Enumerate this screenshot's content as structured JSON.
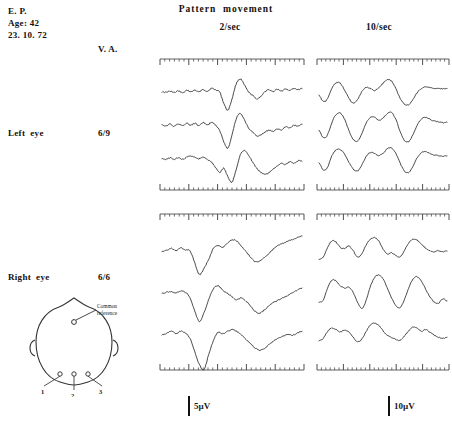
{
  "figure": {
    "title": "Pattern  movement",
    "columns": [
      {
        "id": "2sec",
        "label": "2/sec",
        "calibration": "5µV"
      },
      {
        "id": "10sec",
        "label": "10/sec",
        "calibration": "10µV"
      }
    ],
    "va_header": "V. A."
  },
  "patient": {
    "id": "E. P.",
    "age": "Age: 42",
    "date": "23. 10. 72"
  },
  "rows": [
    {
      "id": "left-eye",
      "label": "Left  eye",
      "va": "6/9"
    },
    {
      "id": "right-eye",
      "label": "Right  eye",
      "va": "6/6"
    }
  ],
  "head_diagram": {
    "reference_label": "Common\nreference",
    "electrodes": [
      {
        "name": "electrode-1",
        "label": "1"
      },
      {
        "name": "electrode-2",
        "label": "2"
      },
      {
        "name": "electrode-3",
        "label": "3"
      }
    ]
  },
  "colors": {
    "trace": "#2a2a2a",
    "ruler": "#3a3a3a",
    "text": "#111111",
    "background": "#ffffff"
  },
  "chart_data": {
    "type": "line",
    "title": "Pattern movement",
    "xlabel": "",
    "ylabel": "",
    "grid": false,
    "legend": "none",
    "ruler": {
      "minor_ticks": 30,
      "major_every": 6
    },
    "panels": [
      {
        "id": "le-2",
        "eye": "Left eye",
        "rate": "2/sec",
        "calibration": "5µV",
        "series": [
          {
            "name": "channel-1",
            "values": [
              0.1,
              0.08,
              0.14,
              0.06,
              0.16,
              0.05,
              0.18,
              0.12,
              0.2,
              0.1,
              0.24,
              0.14,
              0.3,
              0.22,
              0.1,
              -0.55,
              -0.95,
              -0.3,
              0.55,
              0.85,
              0.5,
              0.1,
              -0.1,
              -0.3,
              -0.15,
              0.1,
              0.22,
              0.12,
              0.26,
              0.16,
              0.28,
              0.2,
              0.3,
              0.24,
              0.3
            ]
          },
          {
            "name": "channel-2",
            "values": [
              0.1,
              0.06,
              0.16,
              0.04,
              0.18,
              0.08,
              0.2,
              0.1,
              0.22,
              0.08,
              0.26,
              0.1,
              0.28,
              0.1,
              -0.2,
              -0.85,
              -1.2,
              -0.45,
              0.45,
              0.78,
              0.42,
              -0.05,
              -0.3,
              -0.52,
              -0.45,
              -0.3,
              -0.18,
              -0.24,
              -0.1,
              -0.16,
              0.0,
              -0.06,
              0.1,
              0.04,
              0.16
            ]
          },
          {
            "name": "channel-3",
            "values": [
              0.08,
              0.06,
              0.14,
              0.04,
              0.16,
              0.06,
              0.18,
              0.26,
              0.18,
              0.1,
              0.2,
              0.04,
              -0.1,
              -0.4,
              -0.7,
              -0.45,
              -0.95,
              -1.25,
              -0.55,
              0.3,
              0.55,
              0.3,
              -0.1,
              -0.45,
              -0.7,
              -0.8,
              -0.72,
              -0.5,
              -0.3,
              -0.16,
              -0.24,
              -0.08,
              -0.18,
              -0.02,
              -0.06
            ]
          }
        ]
      },
      {
        "id": "le-10",
        "eye": "Left eye",
        "rate": "10/sec",
        "calibration": "10µV",
        "series": [
          {
            "name": "channel-1",
            "values": [
              -0.1,
              -0.45,
              -0.3,
              0.3,
              0.62,
              0.6,
              0.2,
              -0.25,
              -0.55,
              -0.35,
              0.1,
              0.35,
              0.3,
              0.18,
              0.35,
              0.6,
              0.8,
              0.72,
              0.3,
              -0.25,
              -0.6,
              -0.65,
              -0.35,
              0.05,
              0.3,
              0.4,
              0.35,
              0.3,
              0.32,
              0.28,
              0.3
            ]
          },
          {
            "name": "channel-2",
            "values": [
              -0.2,
              -0.62,
              -0.45,
              0.25,
              0.72,
              0.8,
              0.45,
              -0.2,
              -0.7,
              -0.8,
              -0.4,
              0.2,
              0.55,
              0.58,
              0.4,
              0.52,
              0.78,
              0.82,
              0.45,
              -0.25,
              -0.78,
              -0.85,
              -0.45,
              0.1,
              0.45,
              0.55,
              0.45,
              0.35,
              0.3,
              0.25,
              0.28
            ]
          },
          {
            "name": "channel-3",
            "values": [
              -0.15,
              -0.55,
              -0.4,
              0.25,
              0.6,
              0.62,
              0.35,
              -0.1,
              -0.5,
              -0.62,
              -0.3,
              0.2,
              0.45,
              0.4,
              0.28,
              0.4,
              0.66,
              0.7,
              0.4,
              -0.15,
              -0.62,
              -0.7,
              -0.35,
              0.15,
              0.45,
              0.5,
              0.4,
              0.3,
              0.28,
              0.24,
              0.26
            ]
          }
        ]
      },
      {
        "id": "re-2",
        "eye": "Right eye",
        "rate": "2/sec",
        "calibration": "5µV",
        "series": [
          {
            "name": "channel-1",
            "values": [
              0.05,
              0.12,
              0.22,
              0.1,
              0.22,
              0.14,
              0.1,
              -0.45,
              -1.0,
              -0.7,
              -0.3,
              0.2,
              0.35,
              0.25,
              0.45,
              0.6,
              0.55,
              0.3,
              0.05,
              -0.2,
              -0.42,
              -0.35,
              -0.2,
              0.0,
              0.2,
              0.35,
              0.45,
              0.55,
              0.62,
              0.7,
              0.78
            ]
          },
          {
            "name": "channel-2",
            "values": [
              0.05,
              0.1,
              0.14,
              0.06,
              0.18,
              0.1,
              -0.15,
              -0.75,
              -1.25,
              -0.85,
              -0.25,
              0.25,
              0.4,
              0.2,
              0.05,
              -0.1,
              -0.25,
              -0.15,
              -0.3,
              -0.55,
              -0.78,
              -0.85,
              -0.7,
              -0.5,
              -0.35,
              -0.25,
              -0.15,
              -0.05,
              0.1,
              0.2,
              0.3
            ]
          },
          {
            "name": "channel-3",
            "values": [
              0.06,
              0.14,
              0.24,
              0.12,
              0.24,
              0.14,
              -0.1,
              -0.7,
              -1.3,
              -1.55,
              -0.85,
              -0.2,
              0.18,
              0.1,
              0.22,
              0.3,
              0.22,
              0.05,
              -0.15,
              -0.35,
              -0.55,
              -0.65,
              -0.55,
              -0.38,
              -0.2,
              -0.1,
              0.0,
              0.1,
              0.05,
              0.15,
              0.22
            ]
          }
        ]
      },
      {
        "id": "re-10",
        "eye": "Right eye",
        "rate": "10/sec",
        "calibration": "10µV",
        "series": [
          {
            "name": "channel-1",
            "values": [
              -0.3,
              -0.2,
              0.25,
              0.55,
              0.5,
              0.25,
              0.2,
              0.32,
              0.1,
              -0.2,
              -0.05,
              0.35,
              0.62,
              0.7,
              0.55,
              0.18,
              -0.05,
              0.0,
              -0.12,
              -0.2,
              0.1,
              0.45,
              0.62,
              0.58,
              0.4,
              0.22,
              0.1,
              0.05,
              0.1,
              0.05,
              0.08
            ]
          },
          {
            "name": "channel-2",
            "values": [
              -0.35,
              -0.25,
              0.3,
              0.66,
              0.62,
              0.4,
              0.3,
              0.35,
              0.1,
              -0.35,
              -0.65,
              -0.3,
              0.35,
              0.78,
              0.9,
              0.72,
              0.3,
              -0.15,
              -0.5,
              -0.6,
              -0.25,
              0.3,
              0.7,
              0.82,
              0.62,
              0.25,
              -0.1,
              -0.35,
              -0.4,
              -0.2,
              -0.3
            ]
          },
          {
            "name": "channel-3",
            "values": [
              -0.2,
              -0.1,
              0.22,
              0.38,
              0.3,
              0.2,
              0.28,
              0.2,
              -0.05,
              -0.25,
              -0.15,
              0.2,
              0.5,
              0.6,
              0.5,
              0.25,
              0.05,
              -0.05,
              -0.15,
              -0.2,
              0.0,
              0.25,
              0.42,
              0.38,
              0.22,
              0.3,
              0.18,
              0.05,
              -0.05,
              -0.1,
              -0.05
            ]
          }
        ]
      }
    ]
  }
}
